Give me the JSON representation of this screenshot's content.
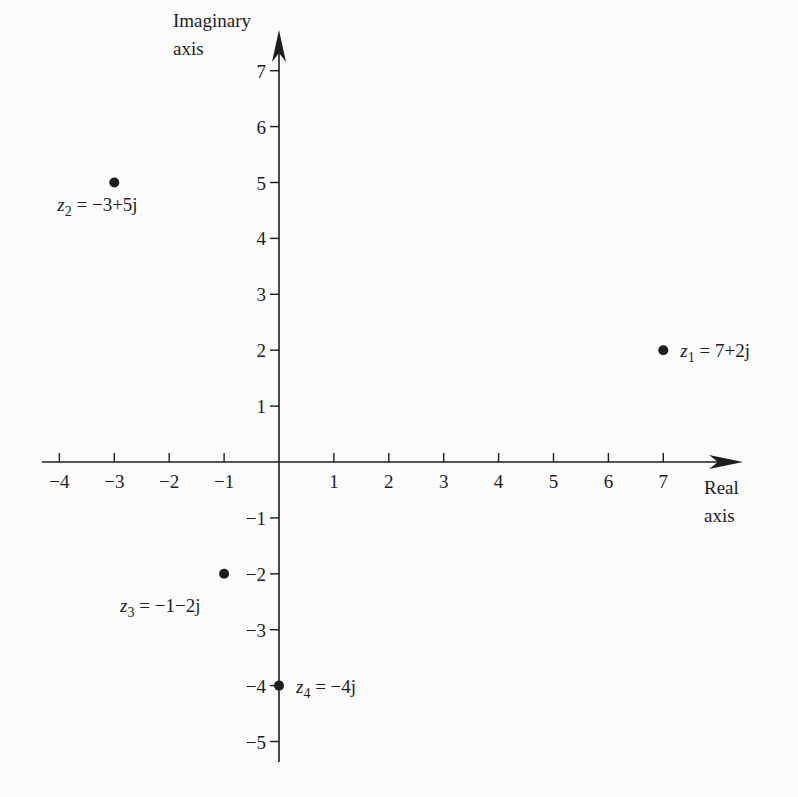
{
  "chart_data": {
    "type": "scatter",
    "title": "",
    "xlabel": "Real axis",
    "ylabel": "Imaginary axis",
    "xlim": [
      -4,
      7
    ],
    "ylim": [
      -5,
      7
    ],
    "grid": false,
    "x_ticks": [
      -4,
      -3,
      -2,
      -1,
      1,
      2,
      3,
      4,
      5,
      6,
      7
    ],
    "y_ticks": [
      7,
      6,
      5,
      4,
      3,
      2,
      1,
      -1,
      -2,
      -3,
      -4,
      -5
    ],
    "x_tick_labels": [
      "-4",
      "-3",
      "-2",
      "-1",
      "1",
      "2",
      "3",
      "4",
      "5",
      "6",
      "7"
    ],
    "y_tick_labels": [
      "7",
      "6",
      "5",
      "4",
      "3",
      "2",
      "1",
      "-1",
      "-2",
      "-3",
      "-4",
      "-5"
    ],
    "points": [
      {
        "name": "z1",
        "sub": "1",
        "x": 7,
        "y": 2,
        "label": " = 7+2j",
        "label_pos": "right"
      },
      {
        "name": "z2",
        "sub": "2",
        "x": -3,
        "y": 5,
        "label": " = −3+5j",
        "label_pos": "below"
      },
      {
        "name": "z3",
        "sub": "3",
        "x": -1,
        "y": -2,
        "label": " = −1−2j",
        "label_pos": "below-left"
      },
      {
        "name": "z4",
        "sub": "4",
        "x": 0,
        "y": -4,
        "label": " = −4j",
        "label_pos": "right"
      }
    ]
  },
  "axes": {
    "x_title_line1": "Real",
    "x_title_line2": "axis",
    "y_title_line1": "Imaginary",
    "y_title_line2": "axis"
  },
  "colors": {
    "ink": "#1d1d1d",
    "background": "#fbfbfb"
  }
}
